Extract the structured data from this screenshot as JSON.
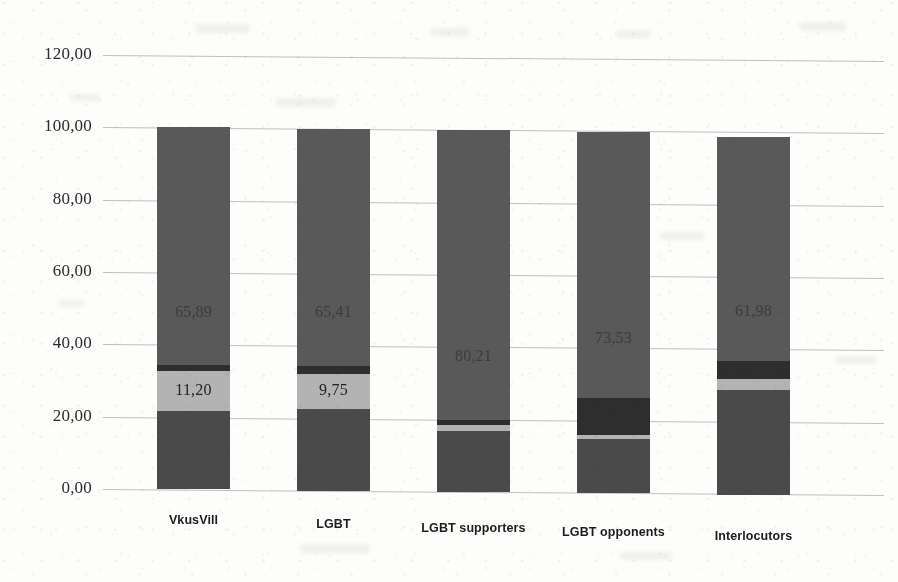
{
  "chart_data": {
    "type": "bar",
    "subtype": "stacked-column",
    "title": "",
    "xlabel": "",
    "ylabel": "",
    "ylim": [
      0,
      120
    ],
    "ytick_step": 20,
    "ytick_labels": [
      "0,00",
      "20,00",
      "40,00",
      "60,00",
      "80,00",
      "100,00",
      "120,00"
    ],
    "ytick_values": [
      0,
      20,
      40,
      60,
      80,
      100,
      120
    ],
    "decimal_separator": ",",
    "grid": "horizontal",
    "legend": "none",
    "categories": [
      "VkusVill",
      "LGBT",
      "LGBT supporters",
      "LGBT opponents",
      "Interlocutors"
    ],
    "series": [
      {
        "name": "segment-1",
        "color": "#4a4a4a",
        "values": [
          21.55,
          22.5,
          16.8,
          14.95,
          29.0
        ],
        "labels": [
          "21,55",
          "22,5",
          "16,8",
          "14,95",
          "29,0"
        ],
        "labels_visible": [
          true,
          true,
          true,
          true,
          true
        ],
        "label_contrast": [
          "faint",
          "faint",
          "faint",
          "faint",
          "faint"
        ]
      },
      {
        "name": "segment-2",
        "color": "#b3b3b3",
        "values": [
          11.2,
          9.75,
          1.6,
          1.2,
          3.2
        ],
        "labels": [
          "11,20",
          "9,75",
          "",
          "",
          ""
        ],
        "labels_visible": [
          true,
          true,
          false,
          false,
          false
        ],
        "label_contrast": [
          "dark-on-light",
          "dark-on-light",
          "none",
          "none",
          "none"
        ]
      },
      {
        "name": "segment-3",
        "color": "#2e2e2e",
        "values": [
          1.4,
          2.3,
          1.4,
          10.3,
          4.8
        ],
        "labels": [
          "",
          "",
          "",
          "",
          ""
        ],
        "labels_visible": [
          false,
          false,
          false,
          false,
          false
        ],
        "label_contrast": [
          "none",
          "none",
          "none",
          "none",
          "none"
        ]
      },
      {
        "name": "segment-4",
        "color": "#595959",
        "values": [
          65.89,
          65.41,
          80.21,
          73.53,
          61.98
        ],
        "labels": [
          "65,89",
          "65,41",
          "80,21",
          "73,53",
          "61,98"
        ],
        "labels_visible": [
          true,
          true,
          true,
          true,
          true
        ],
        "label_contrast": [
          "light-on-gray",
          "light-on-gray",
          "light-on-gray",
          "light-on-gray",
          "light-on-gray"
        ]
      }
    ],
    "totals": [
      100.04,
      99.96,
      100.01,
      99.98,
      98.98
    ]
  },
  "colors": {
    "background": "#fdfdfc",
    "gridline": "#8c8c8c",
    "axis_text": "#2b2b2b",
    "category_text": "#1d1d1d",
    "fill_dark": "#4a4a4a",
    "fill_darkest": "#2e2e2e",
    "fill_light": "#b3b3b3",
    "fill_gray": "#595959"
  }
}
